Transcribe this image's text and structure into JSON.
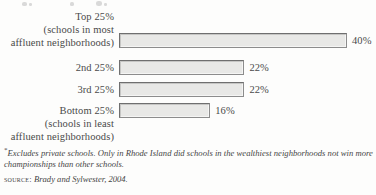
{
  "chart_data": {
    "type": "bar",
    "orientation": "horizontal",
    "title": "",
    "xlabel": "",
    "ylabel": "",
    "grid": false,
    "legend": null,
    "xlim": [
      0,
      40
    ],
    "categories": [
      "Top 25%\n(schools in most\naffluent neighborhoods)",
      "2nd 25%",
      "3rd 25%",
      "Bottom 25%\n(schools in least\naffluent neighborhoods)"
    ],
    "values": [
      40,
      22,
      22,
      16
    ],
    "value_labels": [
      "40%",
      "22%",
      "22%",
      "16%"
    ],
    "bars": [
      {
        "label": "Top 25%\n(schools in most\naffluent neighborhoods)",
        "value": 40,
        "value_label": "40%"
      },
      {
        "label": "2nd 25%",
        "value": 22,
        "value_label": "22%"
      },
      {
        "label": "3rd 25%",
        "value": 22,
        "value_label": "22%"
      },
      {
        "label": "Bottom 25%\n(schools in least\naffluent neighborhoods)",
        "value": 16,
        "value_label": "16%"
      }
    ],
    "annotations": [
      "*Excludes private schools. Only in Rhode Island did schools in the wealthiest neighborhoods not win more championships than other schools.",
      "SOURCE: Brady and Sylwester, 2004."
    ]
  },
  "notes": {
    "footnote_marker": "*",
    "footnote_text": "Excludes private schools. Only in Rhode Island did schools in the wealthiest neighborhoods not win more championships than other schools.",
    "source_label": "Source:",
    "source_text": "Brady and Sylwester, 2004."
  },
  "colors": {
    "bar_fill": "#e8e8e6",
    "bar_border": "#6f6f6f",
    "text": "#454545",
    "page_background": "#fdfdfc"
  }
}
